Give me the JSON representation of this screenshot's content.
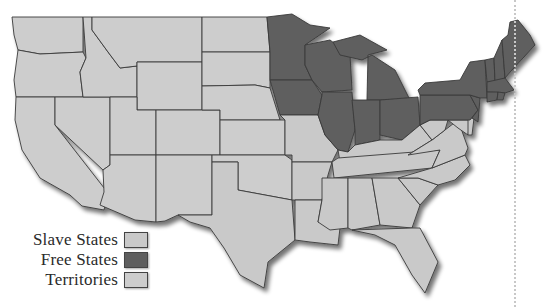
{
  "colors": {
    "slave": "#c9c9c9",
    "free": "#5e5e5e",
    "territory": "#cdcdcd",
    "border": "#3a3a3a",
    "background": "#ffffff",
    "divider": "#c8c8c8"
  },
  "legend": {
    "items": [
      {
        "label": "Slave States",
        "status": "slave"
      },
      {
        "label": "Free States",
        "status": "free"
      },
      {
        "label": "Territories",
        "status": "territory"
      }
    ]
  },
  "map": {
    "regions": [
      {
        "name": "Washington",
        "status": "territory",
        "points": "12,17 83,17 83,52 40,54 18,50 14,35"
      },
      {
        "name": "Oregon",
        "status": "territory",
        "points": "18,50 40,54 83,52 86,58 80,72 83,97 16,97 14,80"
      },
      {
        "name": "California",
        "status": "territory",
        "points": "16,97 55,97 55,125 108,193 104,210 82,206 70,195 40,178 22,150 15,120"
      },
      {
        "name": "Nevada",
        "status": "territory",
        "points": "55,97 110,97 110,165 103,170 55,125"
      },
      {
        "name": "Idaho",
        "status": "territory",
        "points": "83,17 92,17 92,30 108,52 120,68 137,66 137,97 83,97 80,72 86,58"
      },
      {
        "name": "Montana",
        "status": "territory",
        "points": "92,17 202,17 202,62 137,62 137,66 120,68 108,52 92,30"
      },
      {
        "name": "Wyoming",
        "status": "territory",
        "points": "137,62 202,62 202,110 137,110"
      },
      {
        "name": "Utah",
        "status": "territory",
        "points": "110,97 137,97 137,110 156,110 156,155 110,155"
      },
      {
        "name": "Colorado",
        "status": "territory",
        "points": "156,110 220,110 220,155 156,155"
      },
      {
        "name": "Arizona",
        "status": "territory",
        "points": "110,155 156,155 156,222 135,220 100,205 104,192 103,170 110,165"
      },
      {
        "name": "New Mexico",
        "status": "territory",
        "points": "156,155 212,155 212,215 178,215 165,221 156,222"
      },
      {
        "name": "North Dakota",
        "status": "territory",
        "points": "202,17 267,17 270,52 202,52"
      },
      {
        "name": "South Dakota",
        "status": "territory",
        "points": "202,52 270,52 270,88 255,85 202,86"
      },
      {
        "name": "Nebraska",
        "status": "territory",
        "points": "202,86 255,85 270,88 280,120 220,120 220,110 202,110"
      },
      {
        "name": "Kansas",
        "status": "territory",
        "points": "220,120 285,120 285,155 220,155"
      },
      {
        "name": "Oklahoma",
        "status": "territory",
        "points": "212,155 285,155 292,160 292,200 265,195 238,190 238,162 212,162"
      },
      {
        "name": "Texas",
        "status": "slave",
        "points": "212,162 238,162 238,190 265,195 292,200 295,240 268,262 264,288 240,275 224,248 210,228 190,222 178,215 212,215"
      },
      {
        "name": "Minnesota",
        "status": "free",
        "points": "267,17 292,14 310,25 330,28 305,45 305,65 312,80 270,80 270,52"
      },
      {
        "name": "Iowa",
        "status": "free",
        "points": "270,80 312,80 322,95 318,115 280,115"
      },
      {
        "name": "Missouri",
        "status": "slave",
        "points": "280,115 318,115 325,135 338,150 332,162 292,162 292,155 285,155 285,120"
      },
      {
        "name": "Arkansas",
        "status": "slave",
        "points": "292,162 332,162 328,175 322,200 295,200 292,200"
      },
      {
        "name": "Louisiana",
        "status": "slave",
        "points": "295,200 322,200 318,222 340,228 338,245 310,242 295,240"
      },
      {
        "name": "Wisconsin",
        "status": "free",
        "points": "305,45 330,40 350,55 352,90 322,92 312,80 305,65"
      },
      {
        "name": "Illinois",
        "status": "free",
        "points": "322,92 352,92 355,130 348,152 338,150 325,135 318,115 322,95"
      },
      {
        "name": "Michigan",
        "status": "free",
        "points": "333,42 360,35 387,50 368,55 367,100 410,100 395,70 372,55 362,60 340,55"
      },
      {
        "name": "Indiana",
        "status": "free",
        "points": "352,100 380,100 380,140 355,145 355,130"
      },
      {
        "name": "Ohio",
        "status": "free",
        "points": "380,100 418,97 420,125 402,140 380,135"
      },
      {
        "name": "Kentucky",
        "status": "slave",
        "points": "355,145 380,140 402,140 420,125 432,140 408,155 340,162 338,150 348,152"
      },
      {
        "name": "Tennessee",
        "status": "slave",
        "points": "338,158 440,150 432,168 334,178 332,162"
      },
      {
        "name": "Mississippi",
        "status": "slave",
        "points": "322,178 348,178 348,228 330,230 318,222 322,200"
      },
      {
        "name": "Alabama",
        "status": "slave",
        "points": "348,178 372,178 380,225 352,230 348,228"
      },
      {
        "name": "Georgia",
        "status": "slave",
        "points": "372,178 398,178 420,205 412,228 380,225"
      },
      {
        "name": "Florida",
        "status": "slave",
        "points": "352,230 412,228 420,228 438,262 425,293 412,275 395,245 375,235"
      },
      {
        "name": "South Carolina",
        "status": "slave",
        "points": "398,178 418,178 438,185 420,205"
      },
      {
        "name": "North Carolina",
        "status": "slave",
        "points": "432,168 465,155 470,165 455,180 438,185 418,178 398,178"
      },
      {
        "name": "Virginia",
        "status": "slave",
        "points": "408,155 432,140 445,130 458,120 468,148 465,155 432,168 440,150"
      },
      {
        "name": "West Virginia",
        "status": "slave",
        "points": "420,125 430,120 440,112 448,120 445,130 432,140"
      },
      {
        "name": "Maryland",
        "status": "slave",
        "points": "430,120 470,120 468,135 458,128 448,120 440,112"
      },
      {
        "name": "Delaware",
        "status": "slave",
        "points": "468,118 474,118 472,135 468,135"
      },
      {
        "name": "Pennsylvania",
        "status": "free",
        "points": "420,95 470,95 478,110 470,120 430,120 420,125"
      },
      {
        "name": "New Jersey",
        "status": "free",
        "points": "470,95 480,98 478,122 472,118 478,110"
      },
      {
        "name": "New York",
        "status": "free",
        "points": "425,83 460,80 470,62 485,60 487,98 480,98 470,95 420,95 418,90"
      },
      {
        "name": "Vermont",
        "status": "free",
        "points": "485,60 494,58 495,82 487,82"
      },
      {
        "name": "New Hampshire",
        "status": "free",
        "points": "494,58 502,40 505,78 495,82"
      },
      {
        "name": "Maine",
        "status": "free",
        "points": "502,40 508,35 510,22 518,20 530,35 535,45 512,70 505,78"
      },
      {
        "name": "Massachusetts",
        "status": "free",
        "points": "487,82 505,78 514,90 505,93 487,92"
      },
      {
        "name": "Connecticut",
        "status": "free",
        "points": "487,92 498,92 497,100 487,102"
      },
      {
        "name": "Rhode Island",
        "status": "free",
        "points": "498,92 505,93 503,100 497,100"
      }
    ]
  }
}
